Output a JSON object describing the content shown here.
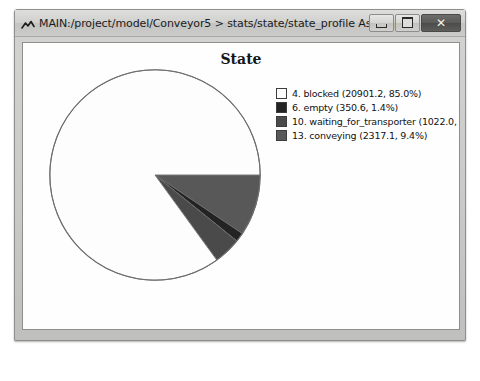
{
  "window": {
    "title": "MAIN:/project/model/Conveyor5 > stats/state/state_profile As Graph",
    "icon": "chart-app-icon",
    "buttons": {
      "minimize": "–",
      "maximize": "□",
      "close": "✕"
    }
  },
  "chart_data": {
    "type": "pie",
    "title": "State",
    "xlabel": "",
    "ylabel": "",
    "legend_position": "right",
    "grid": false,
    "start_angle_deg": 0,
    "direction": "clockwise",
    "categories": [
      "4. blocked",
      "6. empty",
      "10. waiting_for_transporter",
      "13. conveying"
    ],
    "values": [
      20901.2,
      350.6,
      1022.0,
      2317.1
    ],
    "percents": [
      85.0,
      1.4,
      4.2,
      9.4
    ],
    "colors": [
      "#fdfdfd",
      "#232323",
      "#4a4a4a",
      "#585858"
    ],
    "legend_labels": [
      "4. blocked (20901.2, 85.0%)",
      "6. empty (350.6, 1.4%)",
      "10. waiting_for_transporter (1022.0, 4.2",
      "13. conveying (2317.1, 9.4%)"
    ],
    "slice_order_clockwise_from_3oclock": [
      "13. conveying",
      "6. empty",
      "10. waiting_for_transporter",
      "4. blocked"
    ]
  },
  "caption": {
    "text": ""
  }
}
